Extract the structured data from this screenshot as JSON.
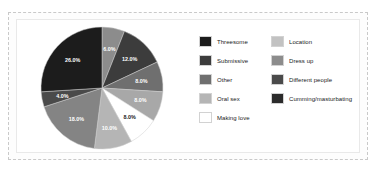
{
  "chart_data": {
    "type": "pie",
    "title": "",
    "categories": [
      "Threesome",
      "Submissive",
      "Other",
      "Oral sex",
      "Making love",
      "Location",
      "Dress up",
      "Different people",
      "Cumming/masturbating"
    ],
    "slices": [
      {
        "label": "Location",
        "value": 6.0,
        "display": "6.0%",
        "color": "#8c8c8c",
        "label_color": "#ffffff"
      },
      {
        "label": "Threesome",
        "value": 12.0,
        "display": "12.0%",
        "color": "#3c3c3c",
        "label_color": "#ffffff"
      },
      {
        "label": "Different people",
        "value": 8.0,
        "display": "8.0%",
        "color": "#6f6f6f",
        "label_color": "#ffffff"
      },
      {
        "label": "Dress up",
        "value": 8.0,
        "display": "8.0%",
        "color": "#a8a8a8",
        "label_color": "#ffffff"
      },
      {
        "label": "Making love",
        "value": 8.0,
        "display": "8.0%",
        "color": "#ffffff",
        "label_color": "#222222"
      },
      {
        "label": "Oral sex",
        "value": 10.0,
        "display": "10.0%",
        "color": "#b5b5b5",
        "label_color": "#ffffff"
      },
      {
        "label": "Other",
        "value": 18.0,
        "display": "18.0%",
        "color": "#848484",
        "label_color": "#ffffff"
      },
      {
        "label": "Submissive",
        "value": 4.0,
        "display": "4.0%",
        "color": "#4a4a4a",
        "label_color": "#ffffff"
      },
      {
        "label": "Cumming/masturbating",
        "value": 26.0,
        "display": "26.0%",
        "color": "#1c1c1c",
        "label_color": "#ffffff"
      }
    ],
    "legend_position": "right",
    "grid": false,
    "xlabel": "",
    "ylabel": ""
  },
  "legend": {
    "left_column": [
      {
        "label": "Threesome",
        "color": "#1c1c1c"
      },
      {
        "label": "Submissive",
        "color": "#3c3c3c"
      },
      {
        "label": "Other",
        "color": "#6f6f6f"
      },
      {
        "label": "Oral sex",
        "color": "#b5b5b5"
      },
      {
        "label": "Making love",
        "color": "#ffffff"
      }
    ],
    "right_column": [
      {
        "label": "Location",
        "color": "#c2c2c2"
      },
      {
        "label": "Dress up",
        "color": "#8c8c8c"
      },
      {
        "label": "Different people",
        "color": "#4a4a4a"
      },
      {
        "label": "Cumming/masturbating",
        "color": "#2b2b2b"
      }
    ]
  }
}
